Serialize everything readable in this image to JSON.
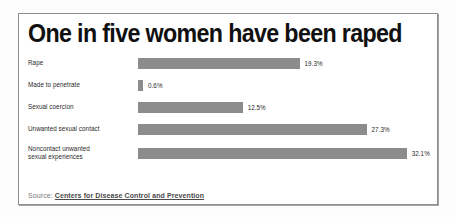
{
  "card": {
    "title": "One in five women have been raped",
    "source_prefix": "Source:",
    "source_link": "Centers for Disease Control and Prevention"
  },
  "chart_data": {
    "type": "bar",
    "orientation": "horizontal",
    "title": "One in five women have been raped",
    "xlabel": "",
    "ylabel": "",
    "xlim": [
      0,
      35
    ],
    "grid": false,
    "legend": null,
    "bar_color": "#8c8c8c",
    "categories": [
      "Rape",
      "Made to penetrate",
      "Sexual coercion",
      "Unwanted sexual contact",
      "Noncontact unwanted sexual experiences"
    ],
    "values": [
      19.3,
      0.6,
      12.5,
      27.3,
      32.1
    ],
    "value_labels": [
      "19.3%",
      "0.6%",
      "12.5%",
      "27.3%",
      "32.1%"
    ],
    "rows": [
      {
        "label_line1": "Rape",
        "label_line2": "",
        "value": 19.3,
        "value_label": "19.3%"
      },
      {
        "label_line1": "Made to penetrate",
        "label_line2": "",
        "value": 0.6,
        "value_label": "0.6%"
      },
      {
        "label_line1": "Sexual coercion",
        "label_line2": "",
        "value": 12.5,
        "value_label": "12.5%"
      },
      {
        "label_line1": "Unwanted sexual contact",
        "label_line2": "",
        "value": 27.3,
        "value_label": "27.3%"
      },
      {
        "label_line1": "Noncontact unwanted",
        "label_line2": "sexual experiences",
        "value": 32.1,
        "value_label": "32.1%"
      }
    ]
  }
}
